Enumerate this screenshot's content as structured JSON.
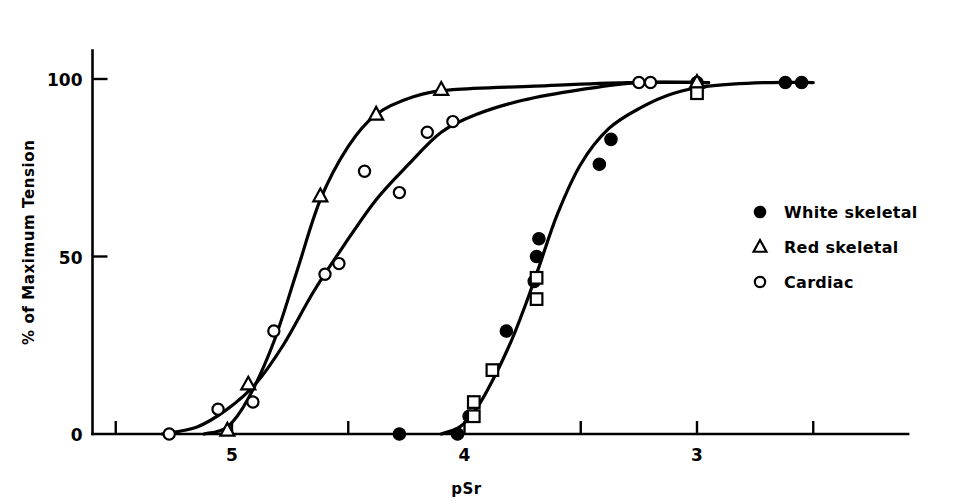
{
  "chart_data": {
    "type": "scatter",
    "title": "",
    "xlabel": "pSr",
    "ylabel": "% of Maximum Tension",
    "xlim": [
      5.6,
      2.35
    ],
    "ylim": [
      0,
      108
    ],
    "x_reversed": true,
    "grid": false,
    "legend_position": "right",
    "x_ticks": [
      {
        "value": 5.5,
        "label": ""
      },
      {
        "value": 5.0,
        "label": "5"
      },
      {
        "value": 4.5,
        "label": ""
      },
      {
        "value": 4.0,
        "label": "4"
      },
      {
        "value": 3.5,
        "label": ""
      },
      {
        "value": 3.0,
        "label": "3"
      },
      {
        "value": 2.5,
        "label": ""
      }
    ],
    "y_ticks": [
      {
        "value": 0,
        "label": "0"
      },
      {
        "value": 50,
        "label": "50"
      },
      {
        "value": 100,
        "label": "100"
      }
    ],
    "series": [
      {
        "name": "White skeletal",
        "marker": "filled-circle",
        "color": "#000000",
        "points": [
          {
            "x": 4.28,
            "y": 0
          },
          {
            "x": 4.03,
            "y": 0
          },
          {
            "x": 3.98,
            "y": 5
          },
          {
            "x": 3.82,
            "y": 29
          },
          {
            "x": 3.7,
            "y": 43
          },
          {
            "x": 3.69,
            "y": 50
          },
          {
            "x": 3.68,
            "y": 55
          },
          {
            "x": 3.42,
            "y": 76
          },
          {
            "x": 3.37,
            "y": 83
          },
          {
            "x": 3.0,
            "y": 99
          },
          {
            "x": 2.62,
            "y": 99
          },
          {
            "x": 2.55,
            "y": 99
          }
        ]
      },
      {
        "name": "Red skeletal",
        "marker": "open-triangle",
        "color": "#000000",
        "points": [
          {
            "x": 5.02,
            "y": 1
          },
          {
            "x": 4.93,
            "y": 14
          },
          {
            "x": 4.62,
            "y": 67
          },
          {
            "x": 4.38,
            "y": 90
          },
          {
            "x": 4.1,
            "y": 97
          },
          {
            "x": 3.0,
            "y": 99
          }
        ]
      },
      {
        "name": "Cardiac",
        "marker": "open-circle",
        "color": "#000000",
        "points": [
          {
            "x": 5.27,
            "y": 0
          },
          {
            "x": 5.06,
            "y": 7
          },
          {
            "x": 4.91,
            "y": 9
          },
          {
            "x": 4.82,
            "y": 29
          },
          {
            "x": 4.6,
            "y": 45
          },
          {
            "x": 4.54,
            "y": 48
          },
          {
            "x": 4.43,
            "y": 74
          },
          {
            "x": 4.28,
            "y": 68
          },
          {
            "x": 4.16,
            "y": 85
          },
          {
            "x": 4.05,
            "y": 88
          },
          {
            "x": 3.25,
            "y": 99
          },
          {
            "x": 3.2,
            "y": 99
          }
        ]
      },
      {
        "name": "White skeletal squares",
        "marker": "open-square",
        "color": "#000000",
        "points": [
          {
            "x": 3.96,
            "y": 9
          },
          {
            "x": 3.96,
            "y": 5
          },
          {
            "x": 3.88,
            "y": 18
          },
          {
            "x": 3.69,
            "y": 44
          },
          {
            "x": 3.69,
            "y": 38
          },
          {
            "x": 3.0,
            "y": 96
          }
        ]
      }
    ],
    "curves": [
      {
        "name": "red-skeletal-curve",
        "points": [
          {
            "x": 5.12,
            "y": 0
          },
          {
            "x": 5.02,
            "y": 2
          },
          {
            "x": 4.93,
            "y": 10
          },
          {
            "x": 4.82,
            "y": 26
          },
          {
            "x": 4.72,
            "y": 46
          },
          {
            "x": 4.62,
            "y": 66
          },
          {
            "x": 4.5,
            "y": 81
          },
          {
            "x": 4.38,
            "y": 90
          },
          {
            "x": 4.22,
            "y": 95
          },
          {
            "x": 4.05,
            "y": 97
          },
          {
            "x": 3.7,
            "y": 98
          },
          {
            "x": 3.3,
            "y": 99
          },
          {
            "x": 2.95,
            "y": 99
          }
        ]
      },
      {
        "name": "cardiac-curve",
        "points": [
          {
            "x": 5.3,
            "y": 0
          },
          {
            "x": 5.15,
            "y": 2
          },
          {
            "x": 5.02,
            "y": 7
          },
          {
            "x": 4.9,
            "y": 14
          },
          {
            "x": 4.78,
            "y": 25
          },
          {
            "x": 4.65,
            "y": 40
          },
          {
            "x": 4.52,
            "y": 53
          },
          {
            "x": 4.38,
            "y": 66
          },
          {
            "x": 4.24,
            "y": 76
          },
          {
            "x": 4.1,
            "y": 85
          },
          {
            "x": 3.95,
            "y": 90
          },
          {
            "x": 3.75,
            "y": 94
          },
          {
            "x": 3.5,
            "y": 97
          },
          {
            "x": 3.25,
            "y": 99
          },
          {
            "x": 2.95,
            "y": 99
          }
        ]
      },
      {
        "name": "white-skeletal-curve",
        "points": [
          {
            "x": 4.1,
            "y": 0
          },
          {
            "x": 4.02,
            "y": 2
          },
          {
            "x": 3.95,
            "y": 7
          },
          {
            "x": 3.88,
            "y": 15
          },
          {
            "x": 3.8,
            "y": 26
          },
          {
            "x": 3.74,
            "y": 36
          },
          {
            "x": 3.68,
            "y": 47
          },
          {
            "x": 3.6,
            "y": 62
          },
          {
            "x": 3.5,
            "y": 76
          },
          {
            "x": 3.38,
            "y": 86
          },
          {
            "x": 3.24,
            "y": 92
          },
          {
            "x": 3.1,
            "y": 96
          },
          {
            "x": 2.95,
            "y": 98
          },
          {
            "x": 2.7,
            "y": 99
          },
          {
            "x": 2.5,
            "y": 99
          }
        ]
      }
    ]
  },
  "legend": {
    "items": [
      {
        "marker": "filled-circle",
        "label": "White skeletal"
      },
      {
        "marker": "open-triangle",
        "label": "Red skeletal"
      },
      {
        "marker": "open-circle",
        "label": "Cardiac"
      }
    ]
  }
}
